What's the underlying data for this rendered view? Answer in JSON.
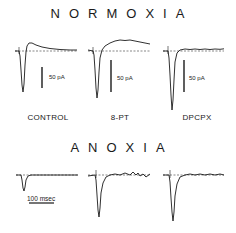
{
  "figure": {
    "panels": [
      {
        "title": "NORMOXIA",
        "conditions": [
          "CONTROL",
          "8-PT",
          "DPCPX"
        ],
        "scale_bars": [
          {
            "label": "50 pA"
          },
          {
            "label": "50 pA"
          },
          {
            "label": "50 pA"
          }
        ]
      },
      {
        "title": "ANOXIA",
        "conditions": [
          "",
          "",
          ""
        ],
        "time_scale": {
          "label": "100 msec"
        }
      }
    ],
    "colors": {
      "trace": "#1a1a1a",
      "baseline": "#555555",
      "background": "#ffffff"
    }
  }
}
